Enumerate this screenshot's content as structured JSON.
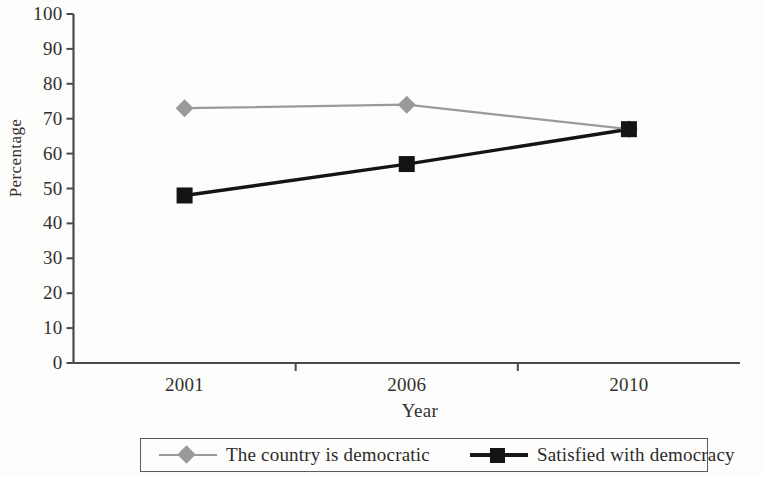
{
  "chart_data": {
    "type": "line",
    "title": "",
    "xlabel": "Year",
    "ylabel": "Percentage",
    "categories": [
      "2001",
      "2006",
      "2010"
    ],
    "ylim": [
      0,
      100
    ],
    "yticks": [
      0,
      10,
      20,
      30,
      40,
      50,
      60,
      70,
      80,
      90,
      100
    ],
    "ytick_labels": [
      "0",
      "10",
      "20",
      "30",
      "40",
      "50",
      "60",
      "70",
      "80",
      "90",
      "100"
    ],
    "grid": false,
    "legend_position": "bottom",
    "series": [
      {
        "name": "The country is democratic",
        "values": [
          73,
          74,
          67
        ],
        "color": "#9a9a9a",
        "marker": "diamond"
      },
      {
        "name": "Satisfied with democracy",
        "values": [
          48,
          57,
          67
        ],
        "color": "#141414",
        "marker": "square"
      }
    ]
  },
  "legend": {
    "entries": [
      {
        "label": "The country is democratic",
        "marker": "diamond-marker-icon"
      },
      {
        "label": "Satisfied with democracy",
        "marker": "square-marker-icon"
      }
    ]
  },
  "colors": {
    "series_gray": "#9a9a9a",
    "series_black": "#141414",
    "axis": "#4a4a4a",
    "text": "#2d2b2a",
    "background": "#fdfdfc"
  }
}
